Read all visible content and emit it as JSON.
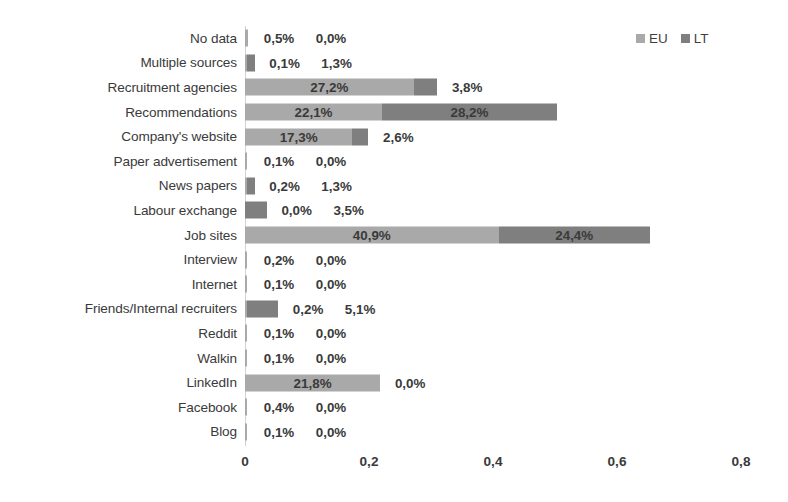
{
  "chart_data": {
    "type": "bar",
    "orientation": "horizontal",
    "stacked": true,
    "title": "",
    "xlabel": "",
    "ylabel": "",
    "xlim": [
      0,
      0.8
    ],
    "xticks": [
      "0",
      "0,2",
      "0,4",
      "0,6",
      "0,8"
    ],
    "xtick_values": [
      0,
      0.2,
      0.4,
      0.6,
      0.8
    ],
    "grid": false,
    "legend_position": "top-right",
    "decimal_separator": ",",
    "colors": {
      "EU": "#a9a9a9",
      "LT": "#7f7f7f"
    },
    "legend": [
      {
        "name": "EU",
        "color": "#a9a9a9"
      },
      {
        "name": "LT",
        "color": "#7f7f7f"
      }
    ],
    "categories": [
      "No data",
      "Multiple sources",
      "Recruitment agencies",
      "Recommendations",
      "Company's website",
      "Paper advertisement",
      "News papers",
      "Labour exchange",
      "Job sites",
      "Interview",
      "Internet",
      "Friends/Internal recruiters",
      "Reddit",
      "Walkin",
      "LinkedIn",
      "Facebook",
      "Blog"
    ],
    "series": [
      {
        "name": "EU",
        "values": [
          0.005,
          0.001,
          0.272,
          0.221,
          0.173,
          0.001,
          0.002,
          0.0,
          0.409,
          0.002,
          0.001,
          0.002,
          0.001,
          0.001,
          0.218,
          0.004,
          0.001
        ],
        "labels": [
          "0,5%",
          "0,1%",
          "27,2%",
          "22,1%",
          "17,3%",
          "0,1%",
          "0,2%",
          "0,0%",
          "40,9%",
          "0,2%",
          "0,1%",
          "0,2%",
          "0,1%",
          "0,1%",
          "21,8%",
          "0,4%",
          "0,1%"
        ]
      },
      {
        "name": "LT",
        "values": [
          0.0,
          0.013,
          0.038,
          0.282,
          0.026,
          0.0,
          0.013,
          0.035,
          0.244,
          0.0,
          0.0,
          0.051,
          0.0,
          0.0,
          0.0,
          0.0,
          0.0
        ],
        "labels": [
          "0,0%",
          "1,3%",
          "3,8%",
          "28,2%",
          "2,6%",
          "0,0%",
          "1,3%",
          "3,5%",
          "24,4%",
          "0,0%",
          "0,0%",
          "5,1%",
          "0,0%",
          "0,0%",
          "0,0%",
          "0,0%",
          "0,0%"
        ]
      }
    ]
  }
}
